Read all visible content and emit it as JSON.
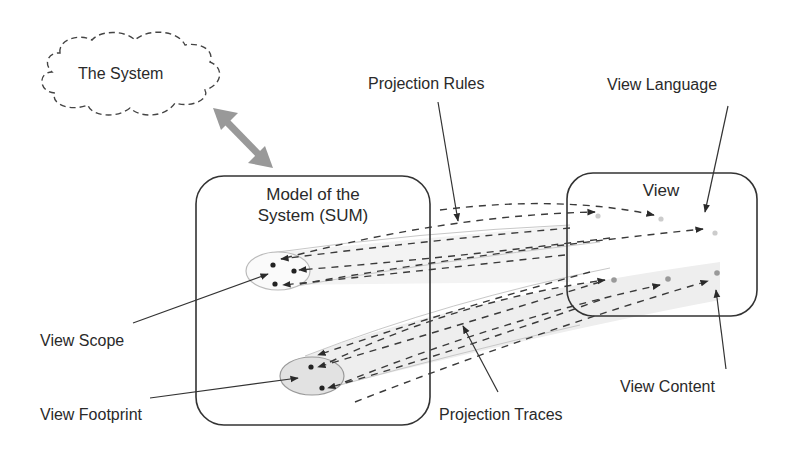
{
  "diagram": {
    "title": "",
    "nodes": {
      "system": {
        "label": "The System",
        "shape": "cloud-dashed"
      },
      "model": {
        "label_line1": "Model of the",
        "label_line2": "System (SUM)",
        "shape": "rounded-rect"
      },
      "view": {
        "label": "View",
        "shape": "rounded-rect"
      }
    },
    "annotations": {
      "projection_rules": "Projection Rules",
      "view_language": "View Language",
      "view_scope": "View Scope",
      "view_footprint": "View Footprint",
      "projection_traces": "Projection Traces",
      "view_content": "View Content"
    },
    "edges": [
      {
        "from": "system",
        "to": "model",
        "style": "thick-gray-bidirectional-arrow"
      },
      {
        "from": "view",
        "to": "model.view_scope",
        "style": "dashed-arrows",
        "count": 3
      },
      {
        "from": "view",
        "to": "model.view_footprint",
        "style": "dashed-arrows",
        "count": 3
      }
    ],
    "colors": {
      "stroke": "#333333",
      "double_arrow": "#999999",
      "trace_band": "#eeeeee",
      "footprint_fill": "#e2e2e2",
      "view_language_dot": "#cccccc",
      "view_content_dot": "#999999"
    }
  }
}
